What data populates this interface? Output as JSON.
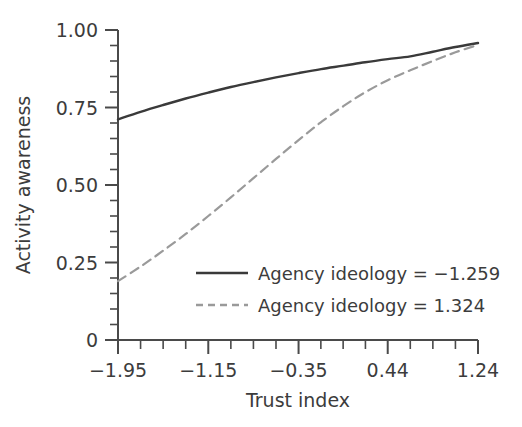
{
  "chart_data": {
    "type": "line",
    "title": "",
    "xlabel": "Trust index",
    "ylabel": "Activity awareness",
    "xlim": [
      -1.95,
      1.24
    ],
    "ylim": [
      0,
      1.0
    ],
    "grid": false,
    "legend_position": "inside-lower-right",
    "y_tick_labels": [
      "1.00",
      "0.75",
      "0.50",
      "0.25",
      "0"
    ],
    "y_tick_values": [
      1.0,
      0.75,
      0.5,
      0.25,
      0
    ],
    "y_minor_step": 0.05,
    "x_tick_labels": [
      "−1.95",
      "−1.15",
      "−0.35",
      "0.44",
      "1.24"
    ],
    "x_tick_values": [
      -1.95,
      -1.15,
      -0.35,
      0.44,
      1.24
    ],
    "x_minor_count_between": 3,
    "series": [
      {
        "name": "Agency ideology = −1.259",
        "style": "solid",
        "color": "#3a3a3a",
        "x": [
          -1.95,
          -1.75,
          -1.55,
          -1.35,
          -1.15,
          -0.95,
          -0.75,
          -0.55,
          -0.35,
          -0.15,
          0.05,
          0.24,
          0.44,
          0.64,
          0.84,
          1.04,
          1.24
        ],
        "values": [
          0.712,
          0.736,
          0.758,
          0.779,
          0.798,
          0.816,
          0.832,
          0.847,
          0.861,
          0.874,
          0.885,
          0.896,
          0.906,
          0.915,
          0.93,
          0.945,
          0.958
        ]
      },
      {
        "name": "Agency ideology = 1.324",
        "style": "dashed",
        "color": "#9a9a9a",
        "x": [
          -1.95,
          -1.75,
          -1.55,
          -1.35,
          -1.15,
          -0.95,
          -0.75,
          -0.55,
          -0.35,
          -0.15,
          0.05,
          0.24,
          0.44,
          0.64,
          0.84,
          1.04,
          1.24
        ],
        "values": [
          0.19,
          0.237,
          0.288,
          0.342,
          0.4,
          0.46,
          0.522,
          0.584,
          0.645,
          0.703,
          0.755,
          0.799,
          0.838,
          0.87,
          0.9,
          0.928,
          0.952
        ]
      }
    ]
  },
  "axes": {
    "y_title": "Activity awareness",
    "x_title": "Trust index",
    "y_ticks": [
      {
        "label": "1.00"
      },
      {
        "label": "0.75"
      },
      {
        "label": "0.50"
      },
      {
        "label": "0.25"
      },
      {
        "label": "0"
      }
    ],
    "x_ticks": [
      {
        "label": "−1.95"
      },
      {
        "label": "−1.15"
      },
      {
        "label": "−0.35"
      },
      {
        "label": "0.44"
      },
      {
        "label": "1.24"
      }
    ]
  },
  "legend": {
    "entries": [
      {
        "label": "Agency ideology = −1.259",
        "style": "solid"
      },
      {
        "label": "Agency ideology = 1.324",
        "style": "dashed"
      }
    ]
  },
  "colors": {
    "series_solid": "#3a3a3a",
    "series_dashed": "#9a9a9a",
    "axis": "#4a4a4a",
    "text": "#3c3c3c",
    "background": "#ffffff"
  }
}
